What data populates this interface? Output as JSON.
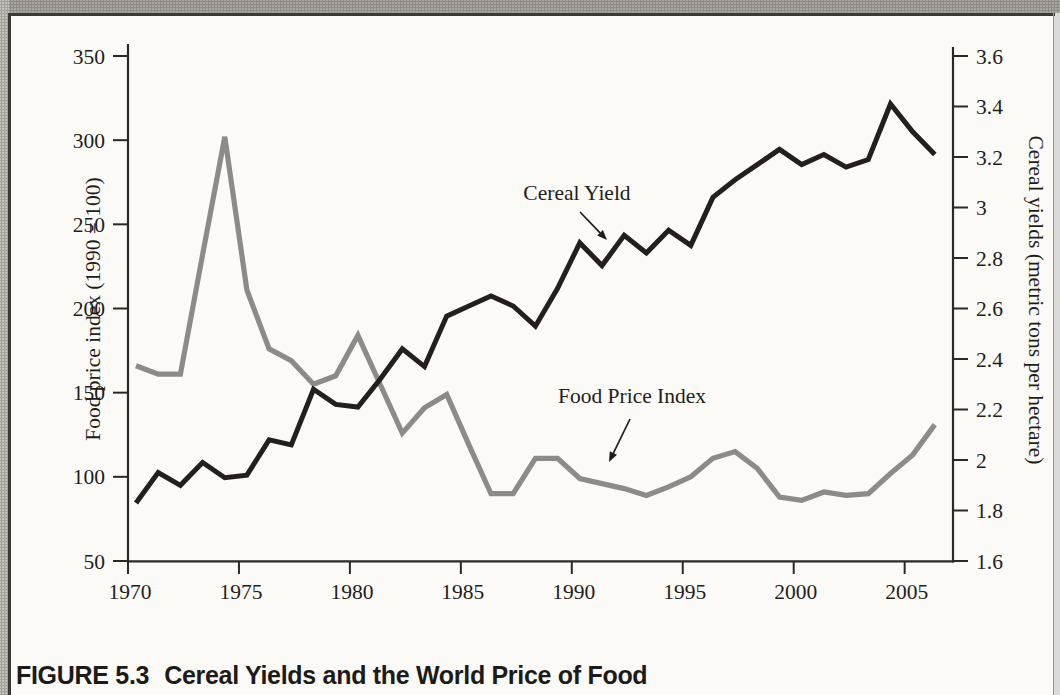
{
  "figure": {
    "caption_label": "FIGURE 5.3",
    "caption_title": "Cereal Yields and the World Price of Food"
  },
  "chart_data": {
    "type": "line",
    "grid": false,
    "legend_position": "none (inline text annotations with arrows)",
    "x": [
      1970,
      1971,
      1972,
      1973,
      1974,
      1975,
      1976,
      1977,
      1978,
      1979,
      1980,
      1981,
      1982,
      1983,
      1984,
      1985,
      1986,
      1987,
      1988,
      1989,
      1990,
      1991,
      1992,
      1993,
      1994,
      1995,
      1996,
      1997,
      1998,
      1999,
      2000,
      2001,
      2002,
      2003,
      2004,
      2005,
      2006
    ],
    "x_axis": {
      "ticks": [
        1970,
        1975,
        1980,
        1985,
        1990,
        1995,
        2000,
        2005
      ]
    },
    "left_axis": {
      "label": "Food price index (1990 = 100)",
      "min": 50,
      "max": 350,
      "ticks": [
        350,
        300,
        250,
        200,
        150,
        100,
        50
      ]
    },
    "right_axis": {
      "label": "Cereal yields (metric tons per hectare)",
      "min": 1.6,
      "max": 3.6,
      "ticks": [
        3.6,
        3.4,
        3.2,
        3.0,
        2.8,
        2.6,
        2.4,
        2.2,
        2.0,
        1.8,
        1.6
      ],
      "tick_labels": [
        "3.6",
        "3.4",
        "3.2",
        "3",
        "2.8",
        "2.6",
        "2.4",
        "2.2",
        "2",
        "1.8",
        "1.6"
      ]
    },
    "series": [
      {
        "name": "Food Price Index",
        "axis": "left",
        "color": "#8d8b88",
        "stroke_width": 5.2,
        "values": [
          166,
          161,
          161,
          232,
          302,
          211,
          176,
          169,
          155,
          160,
          184,
          155,
          126,
          141,
          149,
          119,
          90,
          90,
          111,
          111,
          99,
          96,
          93,
          89,
          94,
          100,
          111,
          115,
          105,
          88,
          86,
          91,
          89,
          90,
          102,
          113,
          131
        ]
      },
      {
        "name": "Cereal Yield",
        "axis": "right",
        "color": "#221f1c",
        "stroke_width": 5,
        "values": [
          1.83,
          1.95,
          1.9,
          1.99,
          1.93,
          1.94,
          2.08,
          2.06,
          2.28,
          2.22,
          2.21,
          2.32,
          2.44,
          2.37,
          2.57,
          2.61,
          2.65,
          2.61,
          2.53,
          2.68,
          2.86,
          2.77,
          2.89,
          2.82,
          2.91,
          2.85,
          3.04,
          3.11,
          3.17,
          3.23,
          3.17,
          3.21,
          3.16,
          3.19,
          3.41,
          3.3,
          3.21
        ]
      }
    ],
    "annotations": [
      {
        "text": "Cereal Yield",
        "x": 577,
        "y": 200,
        "arrow": {
          "x1": 580,
          "y1": 212,
          "x2": 607,
          "y2": 240
        }
      },
      {
        "text": "Food Price Index",
        "x": 632,
        "y": 403,
        "arrow": {
          "x1": 630,
          "y1": 419,
          "x2": 609,
          "y2": 462
        }
      }
    ]
  }
}
